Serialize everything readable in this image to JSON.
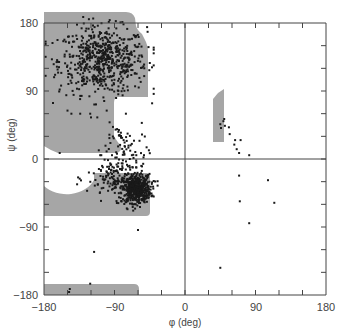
{
  "chart_data": {
    "type": "scatter",
    "title": "",
    "subtitle": "Ramachandran plot",
    "xlabel": "φ (deg)",
    "ylabel": "ψ (deg)",
    "xlim": [
      -180,
      180
    ],
    "ylim": [
      -180,
      180
    ],
    "xticks_labeled": [
      -180,
      -90,
      0,
      90,
      180
    ],
    "yticks_labeled": [
      -180,
      -90,
      0,
      90,
      180
    ],
    "minor_tick_step": 30,
    "grid": false,
    "zero_lines": true,
    "legend": null,
    "colors": {
      "allowed_region": "#a6a6a6",
      "points": "#1a1a1a",
      "axes": "#444444"
    },
    "allowed_regions": [
      {
        "name": "beta-sheet-region",
        "description": "phi -180..-45, psi ~+10..+180 (extends past top), step in at phi ~ -55 below psi ~ +45"
      },
      {
        "name": "alpha-helix-region",
        "description": "phi -180..-27, psi ~ -45..-10, circular cutout near phi -150 psi -10"
      },
      {
        "name": "beta-wrap-region",
        "description": "phi -180..-46, psi -180..-170"
      },
      {
        "name": "left-handed-helix-region",
        "description": "phi ~36..50, psi ~22..90"
      }
    ],
    "clusters": [
      {
        "name": "beta",
        "phi_mean": -105,
        "psi_mean": 130,
        "phi_sd": 28,
        "psi_sd": 22,
        "count": 620
      },
      {
        "name": "alpha-dense",
        "phi_mean": -62,
        "psi_mean": -40,
        "phi_sd": 9,
        "psi_sd": 9,
        "count": 520
      },
      {
        "name": "alpha-diffuse",
        "phi_mean": -85,
        "psi_mean": -25,
        "phi_sd": 20,
        "psi_sd": 14,
        "count": 160
      },
      {
        "name": "bridge",
        "phi_mean": -80,
        "psi_mean": 15,
        "phi_sd": 15,
        "psi_sd": 18,
        "count": 70
      }
    ],
    "outlier_points": [
      [
        45,
        46
      ],
      [
        49,
        50
      ],
      [
        51,
        44
      ],
      [
        46,
        41
      ],
      [
        50,
        53
      ],
      [
        56,
        42
      ],
      [
        57,
        33
      ],
      [
        64,
        25
      ],
      [
        71,
        25
      ],
      [
        63,
        19
      ],
      [
        66,
        13
      ],
      [
        69,
        8
      ],
      [
        82,
        5
      ],
      [
        69,
        -22
      ],
      [
        106,
        -28
      ],
      [
        70,
        -56
      ],
      [
        114,
        -58
      ],
      [
        82,
        -85
      ],
      [
        45,
        -144
      ],
      [
        -116,
        -123
      ],
      [
        -121,
        -165
      ],
      [
        -147,
        -172
      ],
      [
        -148,
        -176
      ],
      [
        -60,
        -94
      ],
      [
        -132,
        173
      ],
      [
        -130,
        188
      ],
      [
        -160,
        92
      ],
      [
        -150,
        64
      ],
      [
        -145,
        60
      ],
      [
        -120,
        55
      ],
      [
        -112,
        55
      ],
      [
        -100,
        64
      ],
      [
        -85,
        36
      ],
      [
        -160,
        8
      ],
      [
        -45,
        127
      ],
      [
        -52,
        120
      ]
    ]
  },
  "axes": {
    "x_title": "φ (deg)",
    "y_title": "ψ (deg)",
    "x_tick_labels": [
      "−180",
      "−90",
      "0",
      "90",
      "180"
    ],
    "y_tick_labels": [
      "180",
      "90",
      "0",
      "−90",
      "−180"
    ]
  }
}
